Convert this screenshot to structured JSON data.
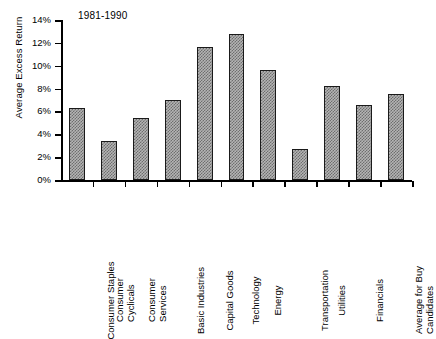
{
  "chart_data": {
    "type": "bar",
    "title": "1981-1990",
    "xlabel": "",
    "ylabel": "Average Excess Return",
    "ylim": [
      0,
      14
    ],
    "ytick_labels": [
      "0%",
      "2%",
      "4%",
      "6%",
      "8%",
      "10%",
      "12%",
      "14%"
    ],
    "ytick_values": [
      0,
      2,
      4,
      6,
      8,
      10,
      12,
      14
    ],
    "grid": false,
    "legend": null,
    "categories": [
      "Consumer Staples",
      "Consumer Cyclicals",
      "Consumer Services",
      "Basic Industries",
      "Capital Goods",
      "Technology",
      "Energy",
      "Transportation",
      "Utilities",
      "Financials",
      "Average for Buy Candidates"
    ],
    "category_lines": [
      [
        "Consumer Staples"
      ],
      [
        "Consumer",
        "Cyclicals"
      ],
      [
        "Consumer",
        "Services"
      ],
      [
        "Basic Industries"
      ],
      [
        "Capital Goods"
      ],
      [
        "Technology"
      ],
      [
        "Energy"
      ],
      [
        "Transportation"
      ],
      [
        "Utilities"
      ],
      [
        "Financials"
      ],
      [
        "Average for Buy",
        "Candidates"
      ]
    ],
    "values": [
      6.3,
      3.4,
      5.4,
      7.0,
      11.6,
      12.8,
      9.6,
      2.7,
      8.2,
      6.6,
      7.5
    ],
    "bar_fill_color": "#b4b4b4",
    "bar_edge_color": "#1a1a1a",
    "axis_color": "#000000"
  }
}
